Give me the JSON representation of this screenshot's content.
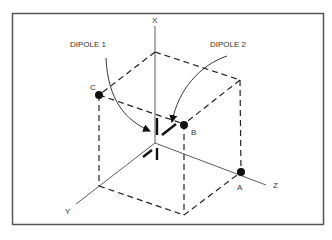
{
  "diagram": {
    "labels": {
      "dipole1": "DIPOLE 1",
      "dipole2": "DIPOLE 2",
      "axis_x": "X",
      "axis_y": "Y",
      "axis_z": "Z",
      "point_a": "A",
      "point_b": "B",
      "point_c": "C"
    },
    "colors": {
      "line": "#222222",
      "frame": "#555555",
      "background": "#ffffff"
    }
  }
}
